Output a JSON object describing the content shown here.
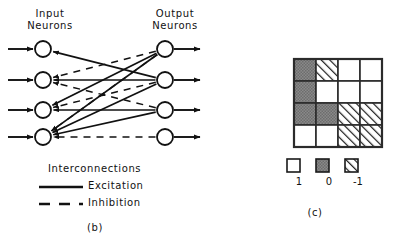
{
  "figure": {
    "panel_b": {
      "caption": "(b)",
      "input_heading": "Input\nNeurons",
      "input_heading_line1": "Input",
      "input_heading_line2": "Neurons",
      "output_heading_line1": "Output",
      "output_heading_line2": "Neurons",
      "legend": {
        "title": "Interconnections",
        "excitation_label": "Excitation",
        "inhibition_label": "Inhibition"
      },
      "neurons": {
        "input_count": 4,
        "output_count": 4,
        "input_x": 43,
        "output_x": 165,
        "rows_y": [
          49,
          80,
          110,
          137
        ],
        "radius": 8
      },
      "connections": [
        {
          "from_output": 1,
          "to_input": 3,
          "type": "excitation"
        },
        {
          "from_output": 1,
          "to_input": 4,
          "type": "excitation"
        },
        {
          "from_output": 2,
          "to_input": 1,
          "type": "excitation"
        },
        {
          "from_output": 2,
          "to_input": 2,
          "type": "excitation"
        },
        {
          "from_output": 2,
          "to_input": 4,
          "type": "excitation"
        },
        {
          "from_output": 3,
          "to_input": 3,
          "type": "excitation"
        },
        {
          "from_output": 3,
          "to_input": 4,
          "type": "excitation"
        },
        {
          "from_output": 1,
          "to_input": 2,
          "type": "inhibition"
        },
        {
          "from_output": 1,
          "to_input": 4,
          "type": "inhibition"
        },
        {
          "from_output": 2,
          "to_input": 3,
          "type": "inhibition"
        },
        {
          "from_output": 3,
          "to_input": 2,
          "type": "inhibition"
        },
        {
          "from_output": 4,
          "to_input": 4,
          "type": "inhibition"
        }
      ]
    },
    "panel_c": {
      "caption": "(c)",
      "matrix": {
        "rows": 4,
        "cols": 4,
        "values": [
          [
            0,
            -1,
            1,
            1
          ],
          [
            0,
            1,
            1,
            1
          ],
          [
            0,
            0,
            -1,
            -1
          ],
          [
            1,
            1,
            -1,
            -1
          ]
        ]
      },
      "legend": {
        "entries": [
          {
            "fill": "white",
            "label": "1"
          },
          {
            "fill": "gray",
            "label": "0"
          },
          {
            "fill": "hatch",
            "label": "-1"
          }
        ]
      }
    }
  },
  "colors": {
    "background": "#ffffff",
    "ink": "#111111",
    "gray_fill": "#808080",
    "cell_border": "#2b2b2b"
  }
}
